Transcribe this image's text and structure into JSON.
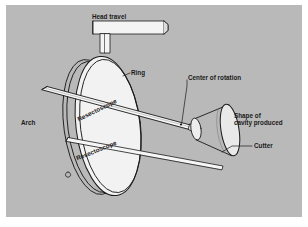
{
  "figure": {
    "background_color": "#b9b9b9",
    "panel_border_color": "#ffffff",
    "line_color": "#1a1a1a",
    "fill_color": "#f2f2f2",
    "shade_color": "#c8c8c8"
  },
  "labels": {
    "head_travel": "Head travel",
    "ring": "Ring",
    "arch": "Arch",
    "center_of_rotation": "Center of rotation",
    "shape_of_cavity": "Shape of\ncavity produced",
    "shape_of_cavity_line1": "Shape of",
    "shape_of_cavity_line2": "cavity produced",
    "cutter": "Cutter",
    "resectoscope_upper": "Resectoscope",
    "resectoscope_lower": "Resectoscope"
  },
  "parts": [
    {
      "name": "head-travel-bar",
      "label": "Head travel"
    },
    {
      "name": "ring",
      "label": "Ring"
    },
    {
      "name": "arch",
      "label": "Arch"
    },
    {
      "name": "center-of-rotation",
      "label": "Center of rotation"
    },
    {
      "name": "cavity-cone",
      "label": "Shape of cavity produced"
    },
    {
      "name": "cutter",
      "label": "Cutter"
    },
    {
      "name": "resectoscope-upper",
      "label": "Resectoscope"
    },
    {
      "name": "resectoscope-lower",
      "label": "Resectoscope"
    }
  ]
}
